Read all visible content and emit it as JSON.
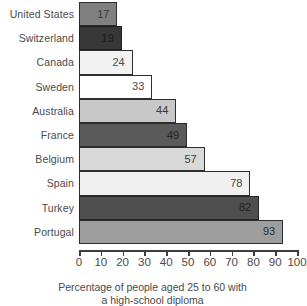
{
  "chart_data": {
    "type": "bar",
    "orientation": "horizontal",
    "title": "",
    "subtitle": "",
    "xlabel": "Percentage of people aged 25 to 60 with a high-school diploma",
    "ylabel": "",
    "xlim": [
      0,
      100
    ],
    "grid": false,
    "legend": null,
    "tick_labels": [
      "0",
      "10",
      "20",
      "30",
      "40",
      "50",
      "60",
      "70",
      "80",
      "90",
      "100"
    ],
    "ticks": [
      0,
      10,
      20,
      30,
      40,
      50,
      60,
      70,
      80,
      90,
      100
    ],
    "categories": [
      "United States",
      "Switzerland",
      "Canada",
      "Sweden",
      "Australia",
      "France",
      "Belgium",
      "Spain",
      "Turkey",
      "Portugal"
    ],
    "values": [
      17,
      19,
      24,
      33,
      44,
      49,
      57,
      78,
      82,
      93
    ],
    "value_labels": [
      "17",
      "19",
      "24",
      "33",
      "44",
      "49",
      "57",
      "78",
      "82",
      "93"
    ],
    "bars": [
      {
        "label": "United States",
        "value": 17,
        "value_label": "17",
        "fill": "#808080",
        "border": "#2e2e2e",
        "text_color": "#3a3a3a"
      },
      {
        "label": "Switzerland",
        "value": 19,
        "value_label": "19",
        "fill": "#383838",
        "border": "#1e1e1e",
        "text_color": "#1a1a1a"
      },
      {
        "label": "Canada",
        "value": 24,
        "value_label": "24",
        "fill": "#f2f2f2",
        "border": "#2e2e2e",
        "text_color": "#4a4a4a"
      },
      {
        "label": "Sweden",
        "value": 33,
        "value_label": "33",
        "fill": "#ffffff",
        "border": "#2e2e2e",
        "text_color": "#4a4a4a"
      },
      {
        "label": "Australia",
        "value": 44,
        "value_label": "44",
        "fill": "#c8c8c8",
        "border": "#2e2e2e",
        "text_color": "#3a3a3a"
      },
      {
        "label": "France",
        "value": 49,
        "value_label": "49",
        "fill": "#5a5a5a",
        "border": "#2a2a2a",
        "text_color": "#232323"
      },
      {
        "label": "Belgium",
        "value": 57,
        "value_label": "57",
        "fill": "#d9d9d9",
        "border": "#2e2e2e",
        "text_color": "#3a3a3a"
      },
      {
        "label": "Spain",
        "value": 78,
        "value_label": "78",
        "fill": "#f0f0f0",
        "border": "#2e2e2e",
        "text_color": "#4a4a4a"
      },
      {
        "label": "Turkey",
        "value": 82,
        "value_label": "82",
        "fill": "#4f4f4f",
        "border": "#262626",
        "text_color": "#1f1f1f"
      },
      {
        "label": "Portugal",
        "value": 93,
        "value_label": "93",
        "fill": "#9e9e9e",
        "border": "#2e2e2e",
        "text_color": "#2e2e2e"
      }
    ]
  },
  "caption": {
    "line1": "Percentage of people aged 25 to 60 with",
    "line2": "a high-school diploma"
  }
}
